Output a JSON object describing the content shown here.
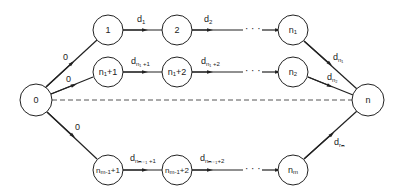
{
  "diagram": {
    "type": "directed network (parallel paths from source to sink)",
    "nodes": [
      {
        "id": "0",
        "label": "0",
        "x": 36,
        "y": 100
      },
      {
        "id": "1",
        "label": "1",
        "x": 108,
        "y": 30
      },
      {
        "id": "2",
        "label": "2",
        "x": 177,
        "y": 30
      },
      {
        "id": "n1",
        "label": "n",
        "sub": "1",
        "x": 293,
        "y": 30
      },
      {
        "id": "n1p1",
        "label": "n",
        "sub": "1",
        "suffix": "+1",
        "x": 108,
        "y": 72
      },
      {
        "id": "n1p2",
        "label": "n",
        "sub": "1",
        "suffix": "+2",
        "x": 177,
        "y": 72
      },
      {
        "id": "n2",
        "label": "n",
        "sub": "2",
        "x": 293,
        "y": 72
      },
      {
        "id": "nm1p1",
        "label": "n",
        "sub": "m-1",
        "suffix": "+1",
        "x": 108,
        "y": 170
      },
      {
        "id": "nm1p2",
        "label": "n",
        "sub": "m-1",
        "suffix": "+2",
        "x": 177,
        "y": 170
      },
      {
        "id": "nm",
        "label": "n",
        "sub": "m",
        "x": 293,
        "y": 170
      },
      {
        "id": "n",
        "label": "n",
        "x": 368,
        "y": 100
      }
    ],
    "edge_labels": {
      "e_0_1": "0",
      "e_0_n1p1": "0",
      "e_0_nm1p1": "0",
      "e_1_2": {
        "base": "d",
        "sub": "1"
      },
      "e_2_dots": {
        "base": "d",
        "sub": "2"
      },
      "e_n1p1_n1p2": {
        "base": "d",
        "sub": "n1 +1"
      },
      "e_n1p2_dots": {
        "base": "d",
        "sub": "n1 +2"
      },
      "e_nm1p1_nm1p2": {
        "base": "d",
        "sub": "nm-1 +1"
      },
      "e_nm1p2_dots": {
        "base": "d",
        "sub": "nm-1 +2"
      },
      "e_n1_n": {
        "base": "d",
        "sub": "n1"
      },
      "e_n2_n": {
        "base": "d",
        "sub": "n2"
      },
      "e_nm_n": {
        "base": "d",
        "sub": "nm"
      }
    },
    "ellipsis": "· · ·"
  }
}
